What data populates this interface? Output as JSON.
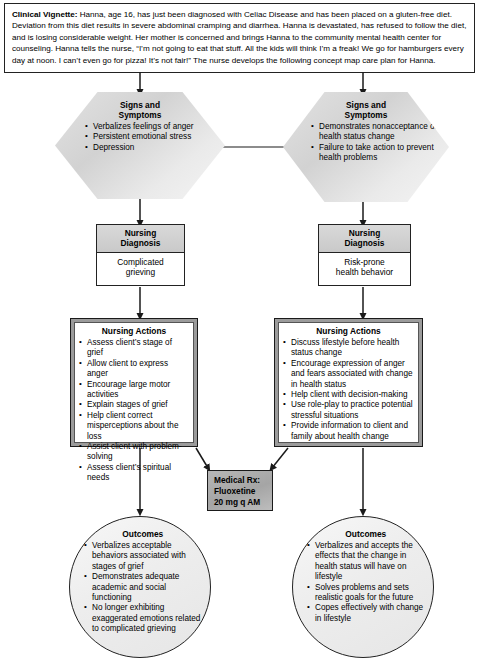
{
  "vignette": {
    "label": "Clinical Vignette:",
    "text": " Hanna, age 16, has just been diagnosed with Celiac Disease and has been placed on a gluten-free diet. Deviation from this diet results in severe abdominal cramping and diarrhea. Hanna is devastated, has refused to follow the diet, and is losing considerable weight. Her mother is concerned and brings Hanna to the community mental health center for counseling. Hanna tells the nurse, “I’m not going to eat that stuff. All the kids will think I’m a freak! We go for hamburgers every day at noon. I can’t even go for pizza! It’s not fair!” The nurse develops the following concept map care plan for Hanna."
  },
  "branches": [
    {
      "id": "left",
      "signs": {
        "title_line1": "Signs and",
        "title_line2": "Symptoms",
        "items": [
          "Verbalizes feelings of anger",
          "Persistent emotional stress",
          "Depression"
        ]
      },
      "diagnosis": {
        "title_line1": "Nursing",
        "title_line2": "Diagnosis",
        "body_line1": "Complicated",
        "body_line2": "grieving"
      },
      "actions": {
        "title": "Nursing Actions",
        "items": [
          "Assess client’s stage of grief",
          "Allow client to express anger",
          "Encourage large motor activities",
          "Explain stages of grief",
          "Help client correct misperceptions about the loss",
          "Assist client with problem-solving",
          "Assess client’s spiritual needs"
        ]
      },
      "outcomes": {
        "title": "Outcomes",
        "items": [
          "Verbalizes acceptable behaviors associated with stages of grief",
          "Demonstrates adequate academic and social functioning",
          "No longer exhibiting exaggerated emotions related to complicated grieving"
        ]
      }
    },
    {
      "id": "right",
      "signs": {
        "title_line1": "Signs and",
        "title_line2": "Symptoms",
        "items": [
          "Demonstrates nonacceptance of health status change",
          "Failure to take action to prevent health problems"
        ]
      },
      "diagnosis": {
        "title_line1": "Nursing",
        "title_line2": "Diagnosis",
        "body_line1": "Risk-prone",
        "body_line2": "health behavior"
      },
      "actions": {
        "title": "Nursing Actions",
        "items": [
          "Discuss lifestyle before health status change",
          "Encourage expression of anger and fears associated with change in health status",
          "Help client with decision-making",
          "Use role-play to practice potential stressful situations",
          "Provide information to client and family about health change"
        ]
      },
      "outcomes": {
        "title": "Outcomes",
        "items": [
          "Verbalizes and accepts the effects that the change in health status will have on lifestyle",
          "Solves problems and sets realistic goals for the future",
          "Copes effectively with change in lifestyle"
        ]
      }
    }
  ],
  "medical_rx": {
    "line1": "Medical Rx:",
    "line2": "Fluoxetine",
    "line3": "20 mg q AM"
  },
  "colors": {
    "line": "#1a1a1a",
    "hex_fill": "#dcdcdc",
    "header_fill": "#d0d0d0",
    "actions_frame": "#9b9b9b",
    "rx_fill": "#adadad",
    "oval_fill": "#efefef"
  }
}
